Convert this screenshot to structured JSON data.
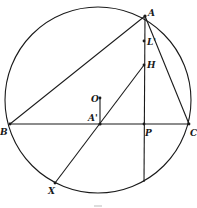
{
  "diagram": {
    "type": "geometry-construction",
    "circle": {
      "cx": 98,
      "cy": 100,
      "r": 93
    },
    "points": {
      "A": {
        "label": "A",
        "x": 145,
        "y": 16
      },
      "L": {
        "label": "L'",
        "x": 144,
        "y": 41
      },
      "H": {
        "label": "H",
        "x": 144,
        "y": 65
      },
      "O": {
        "label": "O",
        "x": 100,
        "y": 98
      },
      "Ap": {
        "label": "A'",
        "x": 100,
        "y": 124
      },
      "B": {
        "label": "B",
        "x": 10,
        "y": 124
      },
      "P": {
        "label": "P",
        "x": 144,
        "y": 124
      },
      "C": {
        "label": "C",
        "x": 189,
        "y": 124
      },
      "X": {
        "label": "X",
        "x": 55,
        "y": 183
      }
    },
    "segments": [
      [
        "A",
        "B"
      ],
      [
        "A",
        "C"
      ],
      [
        "B",
        "C"
      ],
      [
        "A",
        "P-extended"
      ],
      [
        "H",
        "X"
      ],
      [
        "O",
        "Ap"
      ]
    ],
    "altitude_end": {
      "x": 144,
      "y": 182
    },
    "caption": "–"
  },
  "labels": {
    "A": "A",
    "L": "L'",
    "H": "H",
    "O": "O",
    "Ap": "A'",
    "B": "B",
    "P": "P",
    "C": "C",
    "X": "X"
  }
}
